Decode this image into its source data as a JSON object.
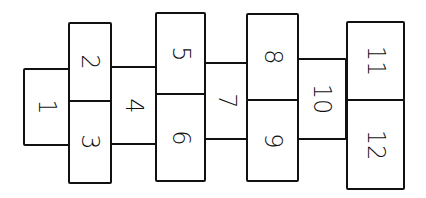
{
  "diagram": {
    "type": "hopscotch-grid",
    "orientation": "rotated 90 degrees (numbers written sideways)",
    "stroke_color": "#111111",
    "background": "#ffffff",
    "cells": [
      {
        "label": "1",
        "x": 23,
        "y": 68,
        "w": 47,
        "h": 78
      },
      {
        "label": "2",
        "x": 68,
        "y": 22,
        "w": 44,
        "h": 80
      },
      {
        "label": "3",
        "x": 68,
        "y": 100,
        "w": 44,
        "h": 84
      },
      {
        "label": "4",
        "x": 110,
        "y": 66,
        "w": 47,
        "h": 79
      },
      {
        "label": "5",
        "x": 155,
        "y": 12,
        "w": 51,
        "h": 83
      },
      {
        "label": "6",
        "x": 155,
        "y": 93,
        "w": 51,
        "h": 89
      },
      {
        "label": "7",
        "x": 204,
        "y": 62,
        "w": 46,
        "h": 78
      },
      {
        "label": "8",
        "x": 246,
        "y": 13,
        "w": 53,
        "h": 88
      },
      {
        "label": "9",
        "x": 246,
        "y": 99,
        "w": 53,
        "h": 83
      },
      {
        "label": "10",
        "x": 297,
        "y": 58,
        "w": 50,
        "h": 82
      },
      {
        "label": "11",
        "x": 346,
        "y": 21,
        "w": 59,
        "h": 80
      },
      {
        "label": "12",
        "x": 346,
        "y": 99,
        "w": 59,
        "h": 91
      }
    ]
  }
}
